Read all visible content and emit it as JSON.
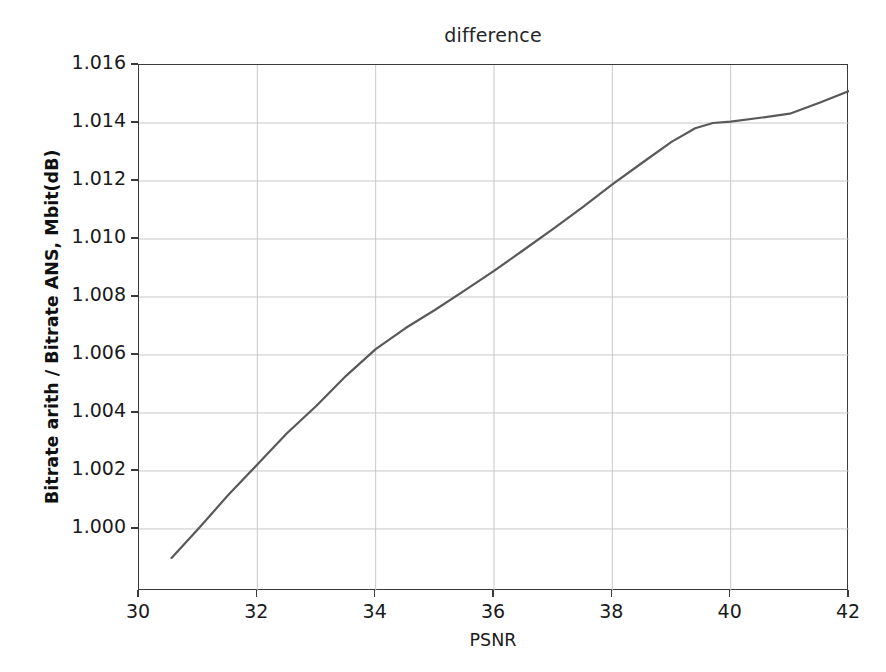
{
  "figure": {
    "title": "difference",
    "background_color": "#ffffff",
    "axes_color": "#3a3a3a",
    "grid_color": "#c8c8c8",
    "line_color": "#595959"
  },
  "axes": {
    "x_label": "PSNR",
    "y_label": "Bitrate arith / Bitrate ANS, Mbit(dB)",
    "x_ticks": [
      "30",
      "32",
      "34",
      "36",
      "38",
      "40",
      "42"
    ],
    "y_ticks": [
      "1.000",
      "1.002",
      "1.004",
      "1.006",
      "1.008",
      "1.010",
      "1.012",
      "1.014",
      "1.016"
    ]
  },
  "chart_data": {
    "type": "line",
    "title": "difference",
    "xlabel": "PSNR",
    "ylabel": "Bitrate arith / Bitrate ANS, Mbit(dB)",
    "xlim": [
      30,
      42
    ],
    "ylim": [
      0.99786,
      1.016
    ],
    "xticks": [
      30,
      32,
      34,
      36,
      38,
      40,
      42
    ],
    "yticks": [
      1.0,
      1.002,
      1.004,
      1.006,
      1.008,
      1.01,
      1.012,
      1.014,
      1.016
    ],
    "grid": true,
    "legend": null,
    "series": [
      {
        "name": "difference",
        "color": "#595959",
        "linewidth": 2.2,
        "x": [
          30.55,
          31.0,
          31.5,
          32.0,
          32.5,
          33.0,
          33.5,
          34.0,
          34.5,
          35.0,
          35.5,
          36.0,
          36.5,
          37.0,
          37.5,
          38.0,
          38.5,
          39.0,
          39.4,
          39.7,
          40.0,
          40.5,
          41.0,
          41.5,
          42.0
        ],
        "y": [
          0.999,
          1.0,
          1.00115,
          1.00222,
          1.0033,
          1.00425,
          1.00528,
          1.0062,
          1.00692,
          1.00755,
          1.00822,
          1.0089,
          1.00962,
          1.01035,
          1.0111,
          1.01188,
          1.01262,
          1.01335,
          1.01382,
          1.014,
          1.01405,
          1.01418,
          1.01432,
          1.0147,
          1.0151
        ]
      }
    ]
  }
}
